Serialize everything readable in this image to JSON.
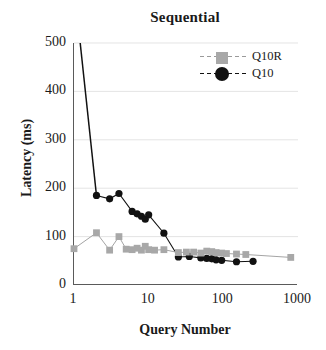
{
  "chart_data": {
    "type": "line",
    "title": "Sequential",
    "xlabel": "Query Number",
    "ylabel": "Latency (ms)",
    "xscale": "log",
    "yscale": "linear",
    "xlim": [
      1,
      1000
    ],
    "ylim": [
      0,
      500
    ],
    "ytick_labels": [
      "0",
      "100",
      "200",
      "300",
      "400",
      "500"
    ],
    "ytick_values": [
      0,
      100,
      200,
      300,
      400,
      500
    ],
    "xtick_labels": [
      "1",
      "10",
      "100",
      "1000"
    ],
    "xtick_values": [
      1,
      10,
      100,
      1000
    ],
    "grid": "horizontal-faint",
    "legend_position": "top-right-inside",
    "series": [
      {
        "name": "Q10R",
        "color": "#a8a8a8",
        "line_color": "#9a9a9a",
        "marker": "square",
        "points": [
          [
            1,
            75
          ],
          [
            2,
            108
          ],
          [
            3,
            72
          ],
          [
            4,
            100
          ],
          [
            5,
            74
          ],
          [
            6,
            73
          ],
          [
            7,
            76
          ],
          [
            8,
            72
          ],
          [
            9,
            80
          ],
          [
            10,
            73
          ],
          [
            12,
            72
          ],
          [
            16,
            73
          ],
          [
            25,
            67
          ],
          [
            32,
            68
          ],
          [
            40,
            68
          ],
          [
            50,
            66
          ],
          [
            60,
            70
          ],
          [
            70,
            69
          ],
          [
            80,
            67
          ],
          [
            95,
            66
          ],
          [
            110,
            65
          ],
          [
            150,
            64
          ],
          [
            200,
            63
          ],
          [
            800,
            57
          ]
        ]
      },
      {
        "name": "Q10",
        "color": "#111111",
        "line_color": "#111111",
        "marker": "circle",
        "note": "First point at x=1 is off the top of the axis (above 500 ms); line enters the frame at the top edge.",
        "points": [
          [
            2,
            185
          ],
          [
            3,
            178
          ],
          [
            4,
            189
          ],
          [
            6,
            152
          ],
          [
            7,
            147
          ],
          [
            8,
            142
          ],
          [
            9,
            136
          ],
          [
            10,
            145
          ],
          [
            16,
            107
          ],
          [
            25,
            58
          ],
          [
            35,
            59
          ],
          [
            50,
            56
          ],
          [
            60,
            55
          ],
          [
            70,
            54
          ],
          [
            80,
            52
          ],
          [
            95,
            51
          ],
          [
            150,
            48
          ],
          [
            250,
            49
          ]
        ],
        "offscale_point": [
          1,
          620
        ]
      }
    ]
  },
  "legend": {
    "items": [
      {
        "label": "Q10R"
      },
      {
        "label": "Q10"
      }
    ]
  }
}
